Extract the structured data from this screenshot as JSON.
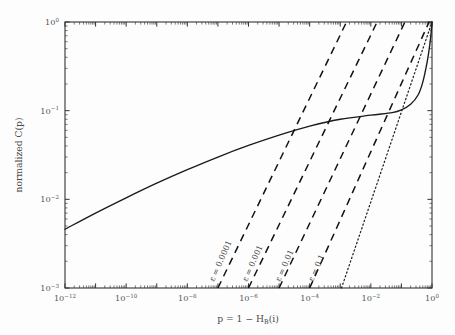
{
  "figure": {
    "background_color": "#fdfdfd",
    "frame_color": "#333333"
  },
  "chart_data": {
    "type": "line",
    "title": "",
    "xlabel": "p = 1 − H_B(i)",
    "xlabel_parts": {
      "p": "p",
      "eq": "=",
      "one": "1",
      "minus": "−",
      "H": "H",
      "sub": "B",
      "arg": "(i)"
    },
    "ylabel": "normalized C(p)",
    "xscale": "log",
    "yscale": "log",
    "xlim": [
      1e-12,
      1
    ],
    "ylim": [
      0.001,
      1
    ],
    "grid": false,
    "legend": "none",
    "xticks": [
      {
        "value": 1e-12,
        "label_mantissa": "10",
        "label_exp": "−12"
      },
      {
        "value": 1e-10,
        "label_mantissa": "10",
        "label_exp": "−10"
      },
      {
        "value": 1e-08,
        "label_mantissa": "10",
        "label_exp": "−8"
      },
      {
        "value": 1e-06,
        "label_mantissa": "10",
        "label_exp": "−6"
      },
      {
        "value": 0.0001,
        "label_mantissa": "10",
        "label_exp": "−4"
      },
      {
        "value": 0.01,
        "label_mantissa": "10",
        "label_exp": "−2"
      },
      {
        "value": 1,
        "label_mantissa": "10",
        "label_exp": "0"
      }
    ],
    "yticks": [
      {
        "value": 1,
        "label_mantissa": "10",
        "label_exp": "0"
      },
      {
        "value": 0.1,
        "label_mantissa": "10",
        "label_exp": "−1"
      },
      {
        "value": 0.01,
        "label_mantissa": "10",
        "label_exp": "−2"
      },
      {
        "value": 0.001,
        "label_mantissa": "10",
        "label_exp": "−3"
      }
    ],
    "series": [
      {
        "name": "normalized C(p)",
        "style": "solid",
        "points": [
          [
            1e-12,
            0.0046
          ],
          [
            1e-11,
            0.007
          ],
          [
            1e-10,
            0.0104
          ],
          [
            1e-09,
            0.0152
          ],
          [
            1e-08,
            0.0216
          ],
          [
            1e-07,
            0.03
          ],
          [
            1e-06,
            0.0405
          ],
          [
            1e-05,
            0.053
          ],
          [
            0.0001,
            0.067
          ],
          [
            0.001,
            0.08
          ],
          [
            0.01,
            0.089
          ],
          [
            0.05,
            0.095
          ],
          [
            0.1,
            0.102
          ],
          [
            0.2,
            0.118
          ],
          [
            0.35,
            0.15
          ],
          [
            0.5,
            0.21
          ],
          [
            0.7,
            0.36
          ],
          [
            0.85,
            0.56
          ],
          [
            0.95,
            0.8
          ],
          [
            1.0,
            1.0
          ]
        ]
      },
      {
        "name": "epsilon = 0.0001",
        "style": "dashed",
        "label": "ε = 0.0001",
        "points": [
          [
            1e-07,
            0.001
          ],
          [
            0.0016,
            1.0
          ]
        ]
      },
      {
        "name": "epsilon = 0.001",
        "style": "dashed",
        "label": "ε = 0.001",
        "points": [
          [
            1e-06,
            0.001
          ],
          [
            0.016,
            1.0
          ]
        ]
      },
      {
        "name": "epsilon = 0.01",
        "style": "dashed",
        "label": "ε = 0.01",
        "points": [
          [
            1e-05,
            0.001
          ],
          [
            0.13,
            1.0
          ]
        ]
      },
      {
        "name": "epsilon = 0.1",
        "style": "dashed",
        "label": "ε = 0.1",
        "points": [
          [
            0.0001,
            0.001
          ],
          [
            0.8,
            1.0
          ]
        ]
      },
      {
        "name": "reference diagonal",
        "style": "dotted",
        "points": [
          [
            0.0011,
            0.001
          ],
          [
            1.0,
            1.0
          ]
        ]
      }
    ],
    "annotations": [
      {
        "text": "ε = 0.0001",
        "rotation": -66,
        "x_px": 214,
        "y_px": 282
      },
      {
        "text": "ε = 0.001",
        "rotation": -66,
        "x_px": 247,
        "y_px": 282
      },
      {
        "text": "ε = 0.01",
        "rotation": -66,
        "x_px": 280,
        "y_px": 282
      },
      {
        "text": "ε = 0.1",
        "rotation": -66,
        "x_px": 313,
        "y_px": 282
      }
    ]
  }
}
